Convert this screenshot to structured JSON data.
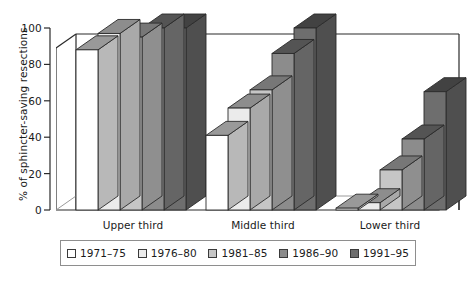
{
  "chart_data": {
    "type": "bar",
    "title": "",
    "subtitle": "",
    "xlabel": "",
    "ylabel": "% of sphincter-saving resections",
    "ylim": [
      0,
      100
    ],
    "yticks": [
      0,
      20,
      40,
      60,
      80,
      100
    ],
    "ytick_labels": [
      "0",
      "20",
      "40",
      "60",
      "80",
      "100"
    ],
    "grid": false,
    "legend_position": "bottom",
    "style": "3d-grouped-bar",
    "categories": [
      "Upper third",
      "Middle third",
      "Lower third"
    ],
    "series": [
      {
        "name": "1971–75",
        "color": "#ffffff",
        "values": [
          88,
          41,
          1
        ]
      },
      {
        "name": "1976–80",
        "color": "#ebebeb",
        "values": [
          97,
          56,
          4
        ]
      },
      {
        "name": "1981–85",
        "color": "#c6c6c6",
        "values": [
          95,
          66,
          22
        ]
      },
      {
        "name": "1986–90",
        "color": "#8c8c8c",
        "values": [
          100,
          86,
          39
        ]
      },
      {
        "name": "1991–95",
        "color": "#6e6e6e",
        "values": [
          100,
          100,
          65
        ]
      }
    ]
  },
  "axis": {
    "tick_0": "0",
    "tick_20": "20",
    "tick_40": "40",
    "tick_60": "60",
    "tick_80": "80",
    "tick_100": "100"
  },
  "categories": {
    "upper": "Upper third",
    "middle": "Middle third",
    "lower": "Lower third"
  },
  "legend": {
    "items": [
      {
        "label": "1971–75"
      },
      {
        "label": "1976–80"
      },
      {
        "label": "1981–85"
      },
      {
        "label": "1986–90"
      },
      {
        "label": "1991–95"
      }
    ]
  }
}
